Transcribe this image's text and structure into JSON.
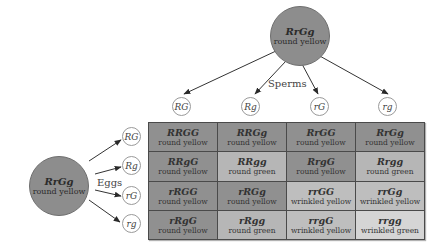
{
  "colors": {
    "round_yellow": "#909090",
    "round_green": "#b6b6b6",
    "wrinkled_yellow": "#bebebe",
    "wrinkled_green": "#d5d5d5",
    "parent_fill": "#8d8d8d"
  },
  "male_parent": {
    "genotype": "RrGg",
    "phenotype": "round yellow"
  },
  "female_parent": {
    "genotype": "RrGg",
    "phenotype": "round yellow"
  },
  "labels": {
    "sperms": "Sperms",
    "eggs": "Eggs"
  },
  "sperms": [
    {
      "allele": "RG"
    },
    {
      "allele": "Rg"
    },
    {
      "allele": "rG"
    },
    {
      "allele": "rg"
    }
  ],
  "eggs": [
    {
      "allele": "RG"
    },
    {
      "allele": "Rg"
    },
    {
      "allele": "rG"
    },
    {
      "allele": "rg"
    }
  ],
  "grid": [
    [
      {
        "genotype": "RRGG",
        "phenotype": "round yellow",
        "type": "round_yellow"
      },
      {
        "genotype": "RRGg",
        "phenotype": "round yellow",
        "type": "round_yellow"
      },
      {
        "genotype": "RrGG",
        "phenotype": "round yellow",
        "type": "round_yellow"
      },
      {
        "genotype": "RrGg",
        "phenotype": "round yellow",
        "type": "round_yellow"
      }
    ],
    [
      {
        "genotype": "RRgG",
        "phenotype": "round yellow",
        "type": "round_yellow"
      },
      {
        "genotype": "RRgg",
        "phenotype": "round green",
        "type": "round_green"
      },
      {
        "genotype": "RrgG",
        "phenotype": "round yellow",
        "type": "round_yellow"
      },
      {
        "genotype": "Rrgg",
        "phenotype": "round green",
        "type": "round_green"
      }
    ],
    [
      {
        "genotype": "rRGG",
        "phenotype": "round yellow",
        "type": "round_yellow"
      },
      {
        "genotype": "rRGg",
        "phenotype": "round yellow",
        "type": "round_yellow"
      },
      {
        "genotype": "rrGG",
        "phenotype": "wrinkled yellow",
        "type": "wrinkled_yellow"
      },
      {
        "genotype": "rrGg",
        "phenotype": "wrinkled yellow",
        "type": "wrinkled_yellow"
      }
    ],
    [
      {
        "genotype": "rRgG",
        "phenotype": "round yellow",
        "type": "round_yellow"
      },
      {
        "genotype": "rRgg",
        "phenotype": "round green",
        "type": "round_green"
      },
      {
        "genotype": "rrgG",
        "phenotype": "wrinkled yellow",
        "type": "wrinkled_yellow"
      },
      {
        "genotype": "rrgg",
        "phenotype": "wrinkled green",
        "type": "wrinkled_green"
      }
    ]
  ]
}
